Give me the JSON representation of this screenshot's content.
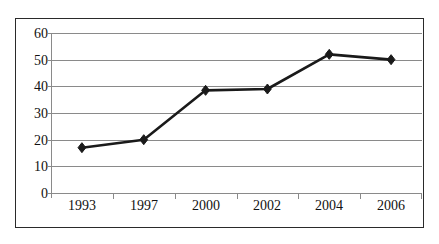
{
  "chart_data": {
    "type": "line",
    "title": "",
    "subtitle": "",
    "xlabel": "",
    "ylabel": "",
    "categories": [
      "1993",
      "1997",
      "2000",
      "2002",
      "2004",
      "2006"
    ],
    "values": [
      17,
      20,
      38.5,
      39,
      52,
      50
    ],
    "series": [
      {
        "name": "",
        "values": [
          17,
          20,
          38.5,
          39,
          52,
          50
        ]
      }
    ],
    "ylim": [
      0,
      60
    ],
    "y_ticks": [
      "0",
      "10",
      "20",
      "30",
      "40",
      "50",
      "60"
    ],
    "y_tick_values": [
      0,
      10,
      20,
      30,
      40,
      50,
      60
    ],
    "y_step": 10,
    "grid": "horizontal",
    "legend": "none",
    "marker": "diamond",
    "colors": {
      "line": "#1a1a1a",
      "marker": "#1a1a1a",
      "grid": "#8a8a8a",
      "axis": "#8a8a8a",
      "frame": "#2a2a2a",
      "background": "#ffffff",
      "text": "#111111"
    }
  }
}
